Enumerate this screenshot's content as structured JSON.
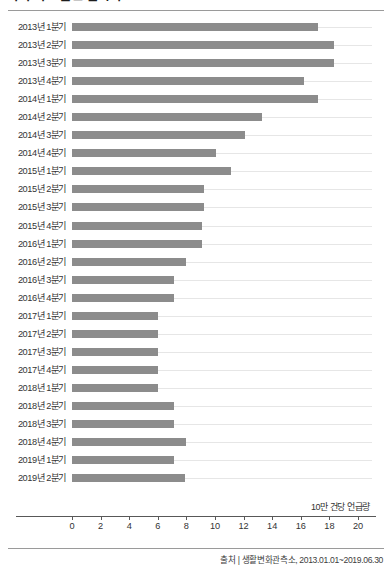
{
  "header": {
    "title": "기획 의도 관련 검색어"
  },
  "axis": {
    "unit_label": "10만 건당 언급량",
    "ticks": [
      "0",
      "2",
      "4",
      "6",
      "8",
      "10",
      "12",
      "14",
      "16",
      "18",
      "20"
    ]
  },
  "footer": {
    "source": "출처 | 생활변화관측소, 2013.01.01~2019.06.30"
  },
  "style": {
    "bar_color": "#8c8c8c",
    "gridline_color": "#e6e6e6",
    "axis_color": "#585858",
    "rule_color": "#9a9a9a",
    "background": "#ffffff"
  },
  "chart_data": {
    "type": "bar",
    "orientation": "horizontal",
    "title": "기획 의도 관련 검색어",
    "xlabel": "10만 건당 언급량",
    "ylabel": "",
    "xlim": [
      0,
      20
    ],
    "xticks": [
      0,
      2,
      4,
      6,
      8,
      10,
      12,
      14,
      16,
      18,
      20
    ],
    "grid": true,
    "legend": false,
    "source": "출처 | 생활변화관측소, 2013.01.01~2019.06.30",
    "categories": [
      "2013년 1분기",
      "2013년 2분기",
      "2013년 3분기",
      "2013년 4분기",
      "2014년 1분기",
      "2014년 2분기",
      "2014년 3분기",
      "2014년 4분기",
      "2015년 1분기",
      "2015년 2분기",
      "2015년 3분기",
      "2015년 4분기",
      "2016년 1분기",
      "2016년 2분기",
      "2016년 3분기",
      "2016년 4분기",
      "2017년 1분기",
      "2017년 2분기",
      "2017년 3분기",
      "2017년 4분기",
      "2018년 1분기",
      "2018년 2분기",
      "2018년 3분기",
      "2018년 4분기",
      "2019년 1분기",
      "2019년 2분기"
    ],
    "values": [
      17.2,
      18.3,
      18.3,
      16.2,
      17.2,
      13.3,
      12.1,
      10.1,
      11.1,
      9.2,
      9.2,
      9.1,
      9.1,
      8.0,
      7.1,
      7.1,
      6.0,
      6.0,
      6.0,
      6.0,
      6.0,
      7.1,
      7.1,
      8.0,
      7.1,
      7.9
    ]
  }
}
